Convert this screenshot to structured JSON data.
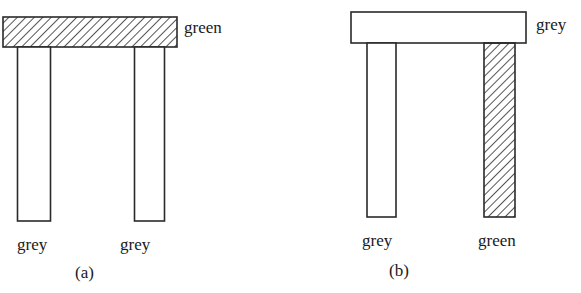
{
  "figure": {
    "panels": [
      {
        "id": "a",
        "caption": "(a)",
        "top_bar": {
          "label": "green",
          "hatched": true
        },
        "legs": [
          {
            "label": "grey",
            "hatched": false
          },
          {
            "label": "grey",
            "hatched": false
          }
        ]
      },
      {
        "id": "b",
        "caption": "(b)",
        "top_bar": {
          "label": "grey",
          "hatched": false
        },
        "legs": [
          {
            "label": "grey",
            "hatched": false
          },
          {
            "label": "green",
            "hatched": true
          }
        ]
      }
    ]
  },
  "colors": {
    "stroke": "#2a2a2a",
    "background": "#ffffff"
  }
}
